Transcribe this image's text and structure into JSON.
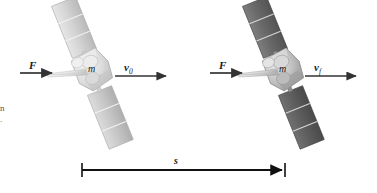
{
  "figure": {
    "background_color": "#ffffff",
    "width": 377,
    "height": 193
  },
  "labels": {
    "force_left": "F",
    "force_right": "F",
    "mass_left": "m",
    "mass_right": "m",
    "velocity_initial_base": "v",
    "velocity_initial_sub": "0",
    "velocity_final_base": "v",
    "velocity_final_sub": "f",
    "displacement": "s"
  },
  "edge_caption_fragment": {
    "line1": "n",
    "line2": "."
  },
  "arrows": {
    "force_left": {
      "x1": 20,
      "y1": 73,
      "x2": 52,
      "y2": 73,
      "color": "#333333"
    },
    "force_right": {
      "x1": 210,
      "y1": 73,
      "x2": 242,
      "y2": 73,
      "color": "#333333"
    },
    "velocity_initial": {
      "x1": 115,
      "y1": 76,
      "x2": 168,
      "y2": 76,
      "color": "#333333"
    },
    "velocity_final": {
      "x1": 305,
      "y1": 76,
      "x2": 358,
      "y2": 76,
      "color": "#333333"
    },
    "displacement": {
      "x1": 82,
      "y1": 170,
      "x2": 285,
      "y2": 170,
      "color": "#111111"
    }
  },
  "satellites": [
    {
      "name": "satellite-initial",
      "center_x": 92,
      "center_y": 72,
      "panel_tone": "light",
      "panel_color_top": "#d8d8d8",
      "panel_color_bottom": "#bcbcbc",
      "body_color": "#e2e2e2",
      "tilt_degrees": -22,
      "panel_segments": 3
    },
    {
      "name": "satellite-final",
      "center_x": 283,
      "center_y": 72,
      "panel_tone": "dark",
      "panel_color_top": "#6e6e6e",
      "panel_color_bottom": "#5a5a5a",
      "body_color": "#c9c9c9",
      "tilt_degrees": -22,
      "panel_segments": 3
    }
  ],
  "colors": {
    "arrow": "#333333",
    "displacement_line": "#111111",
    "text": "#1a1a1a",
    "panel_light": "#cfcfcf",
    "panel_dark": "#666666"
  }
}
